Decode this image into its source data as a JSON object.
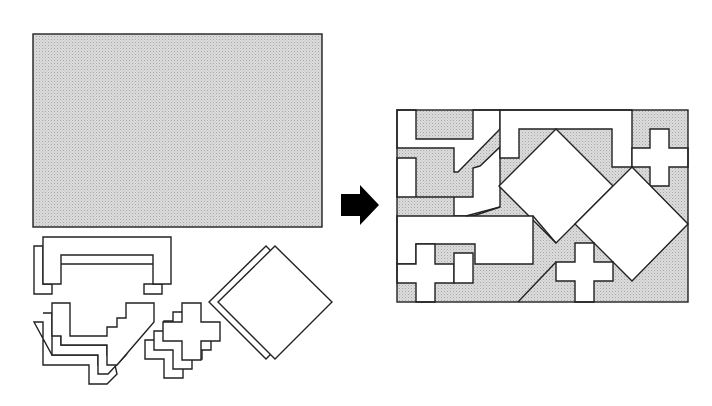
{
  "diagram": {
    "colors": {
      "board_fill": "#d9d9d9",
      "board_dot": "#b5b5b5",
      "piece_fill": "#ffffff",
      "outline": "#222222",
      "arrow": "#000000"
    },
    "left_panel": {
      "board": {
        "x": 33,
        "y": 34,
        "width": 289,
        "height": 193
      },
      "pieces": [
        {
          "name": "c-shaped-piece",
          "count": 2
        },
        {
          "name": "stepped-diagonal-piece",
          "count": 3
        },
        {
          "name": "cross-piece",
          "count": 3
        },
        {
          "name": "square-diamond-piece",
          "count": 2
        }
      ]
    },
    "arrow": {
      "direction": "right"
    },
    "right_panel": {
      "frame": {
        "x": 397,
        "y": 110,
        "width": 291,
        "height": 192
      }
    }
  }
}
